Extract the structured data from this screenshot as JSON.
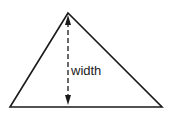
{
  "diagram": {
    "shape": "triangle",
    "label": "width",
    "colors": {
      "stroke": "#1a1a1a",
      "background": "#ffffff"
    }
  }
}
